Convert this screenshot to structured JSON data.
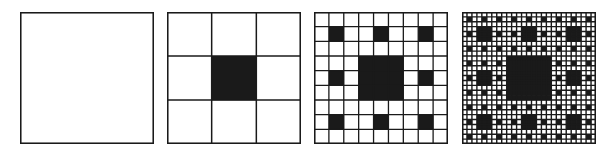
{
  "figure": {
    "background": "#ffffff",
    "ink": "#1a1a1a",
    "panels": [
      {
        "iteration": 0,
        "grid": 1,
        "x": 20,
        "label": "Iteration 0"
      },
      {
        "iteration": 1,
        "grid": 3,
        "x": 167,
        "label": "Iteration 1"
      },
      {
        "iteration": 2,
        "grid": 9,
        "x": 314,
        "label": "Iteration 2"
      },
      {
        "iteration": 3,
        "grid": 27,
        "x": 462,
        "label": "Iteration 3"
      }
    ]
  }
}
